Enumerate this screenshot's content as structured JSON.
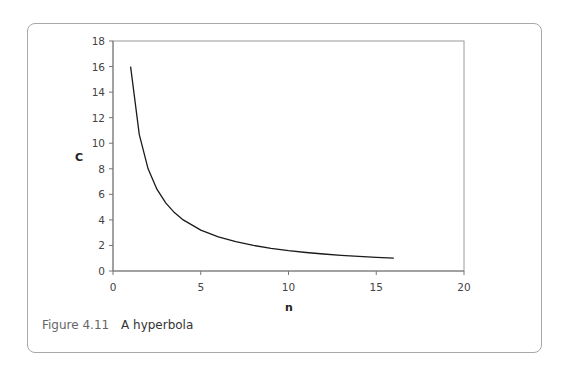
{
  "figure": {
    "number": "Figure 4.11",
    "title": "A hyperbola"
  },
  "chart_data": {
    "type": "line",
    "title": "A hyperbola",
    "xlabel": "n",
    "ylabel": "C",
    "xlim": [
      0,
      20
    ],
    "ylim": [
      0,
      18
    ],
    "x_ticks": [
      0,
      5,
      10,
      15,
      20
    ],
    "y_ticks": [
      0,
      2,
      4,
      6,
      8,
      10,
      12,
      14,
      16,
      18
    ],
    "grid": false,
    "legend": null,
    "series": [
      {
        "name": "C = 16/n",
        "x": [
          1,
          1.5,
          2,
          2.5,
          3,
          3.5,
          4,
          5,
          6,
          7,
          8,
          9,
          10,
          11,
          12,
          13,
          14,
          15,
          16
        ],
        "y": [
          16,
          10.67,
          8,
          6.4,
          5.33,
          4.57,
          4,
          3.2,
          2.67,
          2.29,
          2,
          1.78,
          1.6,
          1.45,
          1.33,
          1.23,
          1.14,
          1.07,
          1
        ],
        "color": "#1a1a1a"
      }
    ]
  }
}
